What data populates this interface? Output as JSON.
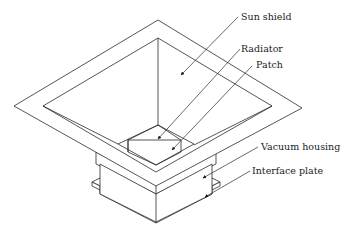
{
  "diagram": {
    "type": "isometric-technical-drawing",
    "line_color": "#2a2a2a",
    "labels": [
      {
        "id": "sun_shield",
        "text": "Sun shield"
      },
      {
        "id": "radiator",
        "text": "Radiator"
      },
      {
        "id": "patch",
        "text": "Patch"
      },
      {
        "id": "vacuum_housing",
        "text": "Vacuum housing"
      },
      {
        "id": "interface_plate",
        "text": "Interface plate"
      }
    ]
  }
}
